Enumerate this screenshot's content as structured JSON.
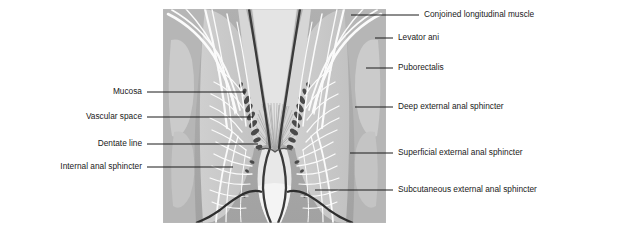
{
  "figure": {
    "panel": {
      "x": 163,
      "y": 9,
      "width": 223,
      "height": 214,
      "background_color": "#a9a9a9",
      "midtone_color": "#c6c6c6",
      "light_color": "#dcdcdc",
      "highlight_color": "#f2f2f2",
      "outline_color": "#3a3a3a"
    },
    "leader_color": "#1a1a1a",
    "text_color": "#1a1a1a"
  },
  "labels_left": [
    {
      "id": "mucosa",
      "text": "Mucosa",
      "text_x": 142,
      "text_y": 95,
      "line_x1": 147,
      "line_x2": 245,
      "line_y": 92,
      "target_x": 245,
      "target_y": 92
    },
    {
      "id": "vascular-space",
      "text": "Vascular space",
      "text_x": 142,
      "text_y": 120,
      "line_x1": 147,
      "line_x2": 253,
      "line_y": 117,
      "target_x": 253,
      "target_y": 117
    },
    {
      "id": "dentate-line",
      "text": "Dentate line",
      "text_x": 142,
      "text_y": 147,
      "line_x1": 147,
      "line_x2": 258,
      "line_y": 144,
      "target_x": 258,
      "target_y": 144
    },
    {
      "id": "internal-anal-sphincter",
      "text": "Internal anal sphincter",
      "text_x": 142,
      "text_y": 170,
      "line_x1": 147,
      "line_x2": 233,
      "line_y": 167,
      "target_x": 233,
      "target_y": 167
    }
  ],
  "labels_right": [
    {
      "id": "conjoined-longitudinal-muscle",
      "text": "Conjoined longitudinal muscle",
      "text_x": 424,
      "text_y": 18,
      "line_x1": 351,
      "line_x2": 419,
      "line_y": 15,
      "target_x": 351,
      "target_y": 15
    },
    {
      "id": "levator-ani",
      "text": "Levator ani",
      "text_x": 398,
      "text_y": 41,
      "line_x1": 375,
      "line_x2": 393,
      "line_y": 38,
      "target_x": 375,
      "target_y": 38
    },
    {
      "id": "puborectalis",
      "text": "Puborectalis",
      "text_x": 398,
      "text_y": 71,
      "line_x1": 366,
      "line_x2": 393,
      "line_y": 68,
      "target_x": 366,
      "target_y": 68
    },
    {
      "id": "deep-external-anal-sphincter",
      "text": "Deep external anal sphincter",
      "text_x": 398,
      "text_y": 110,
      "line_x1": 355,
      "line_x2": 393,
      "line_y": 107,
      "target_x": 355,
      "target_y": 107
    },
    {
      "id": "superficial-external-anal-sphincter",
      "text": "Superficial external anal sphincter",
      "text_x": 398,
      "text_y": 156,
      "line_x1": 350,
      "line_x2": 393,
      "line_y": 153,
      "target_x": 350,
      "target_y": 153
    },
    {
      "id": "subcutaneous-external-anal-sphincter",
      "text": "Subcutaneous external anal sphincter",
      "text_x": 398,
      "text_y": 193,
      "line_x1": 315,
      "line_x2": 393,
      "line_y": 190,
      "target_x": 315,
      "target_y": 190
    }
  ]
}
